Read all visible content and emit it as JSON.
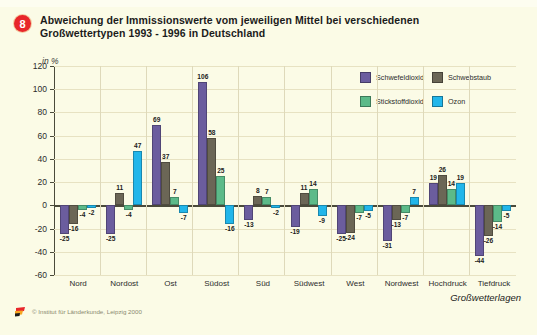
{
  "header": {
    "badge": "8",
    "title_line1": "Abweichung der Immissionswerte vom jeweiligen Mittel bei verschiedenen",
    "title_line2": "Großwettertypen 1993 - 1996 in Deutschland"
  },
  "footer": {
    "credit": "© Institut für Länderkunde, Leipzig 2000",
    "logo_icon": "ifl-flag-logo"
  },
  "colors": {
    "schwefeldioxid": "#6b5d9e",
    "schwebstaub": "#6b6656",
    "stickstoffdioxid": "#5cba89",
    "ozon": "#22b6ea",
    "background": "#fbfbe6",
    "axis": "#4a4a3a",
    "grid": "#e7e2c2",
    "badge": "#e8262a"
  },
  "chart_data": {
    "type": "bar",
    "title": "Abweichung der Immissionswerte vom jeweiligen Mittel bei verschiedenen Großwettertypen 1993 - 1996 in Deutschland",
    "subtitle": "",
    "xlabel": "Großwetterlagen",
    "ylabel": "in %",
    "unit": "in %",
    "ylim": [
      -60,
      120
    ],
    "yticks": [
      120,
      100,
      80,
      60,
      40,
      20,
      0,
      -20,
      -40,
      -60
    ],
    "grid": true,
    "legend_position": "top-right",
    "categories": [
      "Nord",
      "Nordost",
      "Ost",
      "Südost",
      "Süd",
      "Südwest",
      "West",
      "Nordwest",
      "Hochdruck",
      "Tiefdruck"
    ],
    "series": [
      {
        "name": "Schwefeldioxid",
        "color": "#6b5d9e",
        "values": [
          -25,
          -25,
          69,
          106,
          -13,
          -19,
          -25,
          -31,
          19,
          -44
        ]
      },
      {
        "name": "Schwebstaub",
        "color": "#6b6656",
        "values": [
          -16,
          11,
          37,
          58,
          8,
          11,
          -24,
          -13,
          26,
          -26
        ]
      },
      {
        "name": "Stickstoffdioxid",
        "color": "#5cba89",
        "values": [
          -4,
          -4,
          7,
          25,
          7,
          14,
          -7,
          -7,
          14,
          -14
        ]
      },
      {
        "name": "Ozon",
        "color": "#22b6ea",
        "values": [
          -2,
          47,
          -7,
          -16,
          -2,
          -9,
          -5,
          7,
          19,
          -5
        ]
      }
    ]
  }
}
